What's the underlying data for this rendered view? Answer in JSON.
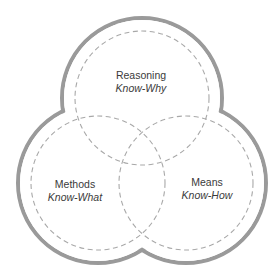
{
  "diagram": {
    "type": "three-circle venn",
    "colors": {
      "outer_stroke": "#9a9a9a",
      "dashed_stroke": "#a8a8a8",
      "text": "#3a3a3a",
      "background": "#ffffff"
    },
    "circles": [
      {
        "id": "reasoning",
        "title": "Reasoning",
        "subtitle": "Know-Why",
        "position": "top"
      },
      {
        "id": "methods",
        "title": "Methods",
        "subtitle": "Know-What",
        "position": "bottom-left"
      },
      {
        "id": "means",
        "title": "Means",
        "subtitle": "Know-How",
        "position": "bottom-right"
      }
    ]
  }
}
